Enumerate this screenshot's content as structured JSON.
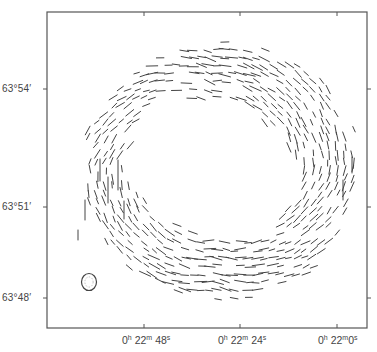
{
  "figure": {
    "type": "polarization-vector-map",
    "frame": {
      "left": 47,
      "top": 12,
      "right": 367,
      "bottom": 328,
      "color": "#555555"
    },
    "y_axis": {
      "label_unit": "Declination",
      "ticks": [
        {
          "label": "63°54′",
          "y": 89
        },
        {
          "label": "63°51′",
          "y": 207
        },
        {
          "label": "63°48′",
          "y": 298
        }
      ]
    },
    "x_axis": {
      "label_unit": "Right Ascension",
      "ticks": [
        {
          "h": "0",
          "m": "22",
          "s": "48",
          "x": 144
        },
        {
          "h": "0",
          "m": "22",
          "s": "24",
          "x": 240
        },
        {
          "h": "0",
          "m": "22",
          "s": "0",
          "x": 337
        }
      ],
      "top_ticks_x": [
        144,
        240,
        337
      ],
      "right_ticks_y": [
        89,
        207,
        298
      ]
    },
    "beam": {
      "cx": 89,
      "cy": 282,
      "rx": 7.5,
      "ry": 8.5,
      "label": "beam"
    },
    "shell": {
      "center_x": 212,
      "center_y": 168,
      "inner_radius": 78,
      "outer_radius": 140,
      "vector_color": "#444444",
      "vector_length": 8,
      "grid_step": 8
    }
  },
  "labels": {
    "y_ticks": [
      "63°54′",
      "63°51′",
      "63°48′"
    ],
    "x_ticks": [
      "0h 22m 48s",
      "0h 22m 24s",
      "0h 22m 0s"
    ]
  }
}
